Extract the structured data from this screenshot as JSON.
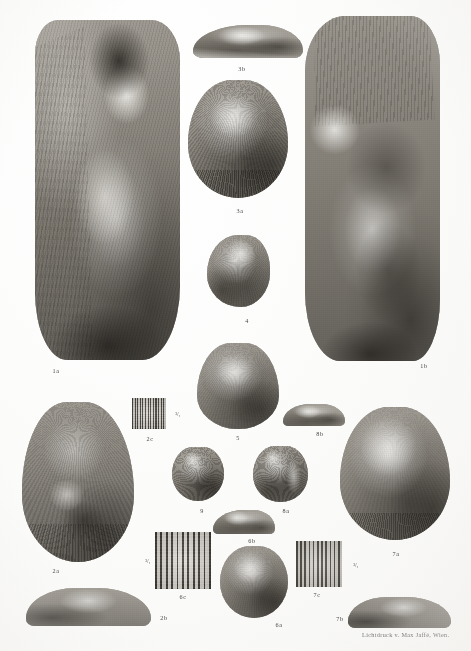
{
  "plate": {
    "medium": "collotype photographic plate",
    "background_color": "#fdfdfc",
    "ink_color": "#2a2a28",
    "credit": "Lichtdruck v. Max Jaffé, Wien."
  },
  "figures": [
    {
      "id": "1a",
      "label": "1a",
      "description": "large shell, exterior view with broken umbo and matrix"
    },
    {
      "id": "1b",
      "label": "1b",
      "description": "large shell, opposite valve with plicate umbo"
    },
    {
      "id": "2a",
      "label": "2a",
      "description": "large ribbed shell, ventral view"
    },
    {
      "id": "2b",
      "label": "2b",
      "description": "large shell, profile view"
    },
    {
      "id": "2c",
      "label": "2c",
      "description": "enlarged ornament of figure 2"
    },
    {
      "id": "3a",
      "label": "3a",
      "description": "medium shell, ventral view"
    },
    {
      "id": "3b",
      "label": "3b",
      "description": "medium shell, profile view"
    },
    {
      "id": "4",
      "label": "4",
      "description": "small ovate shell"
    },
    {
      "id": "5",
      "label": "5",
      "description": "small triangular shell"
    },
    {
      "id": "6a",
      "label": "6a",
      "description": "rounded shell, ventral view"
    },
    {
      "id": "6b",
      "label": "6b",
      "description": "rounded shell, profile view"
    },
    {
      "id": "6c",
      "label": "6c",
      "description": "enlarged ornament of figure 6"
    },
    {
      "id": "7a",
      "label": "7a",
      "description": "large rounded shell, ventral view"
    },
    {
      "id": "7b",
      "label": "7b",
      "description": "large rounded shell, profile view"
    },
    {
      "id": "7c",
      "label": "7c",
      "description": "enlarged ornament of figure 7"
    },
    {
      "id": "8a",
      "label": "8a",
      "description": "small ribbed shell, ventral view"
    },
    {
      "id": "8b",
      "label": "8b",
      "description": "small ribbed shell, profile view"
    },
    {
      "id": "9",
      "label": "9",
      "description": "small ribbed shell, ventral view"
    }
  ],
  "scale_marks": [
    {
      "id": "2c",
      "label": "³/₁"
    },
    {
      "id": "6c",
      "label": "³/₁"
    },
    {
      "id": "7c",
      "label": "³/₁"
    }
  ]
}
